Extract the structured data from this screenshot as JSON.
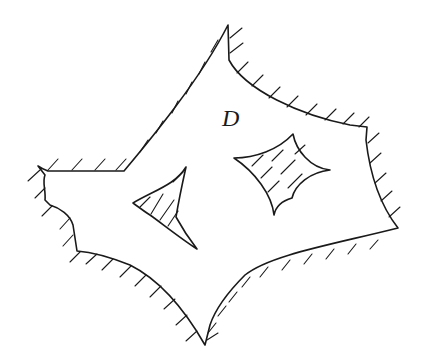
{
  "diagram": {
    "type": "multiply-connected domain sketch",
    "domain_label": "D",
    "outer_boundary": {
      "description": "Outer boundary of domain with exterior hatching",
      "hatched": true
    },
    "holes": [
      {
        "name": "triangular-hole",
        "shape": "concave triangle",
        "hatched": true
      },
      {
        "name": "quadrilateral-hole",
        "shape": "concave quadrilateral (astroid-like)",
        "hatched": true
      }
    ],
    "colors": {
      "stroke": "#1a1a1a",
      "background": "#ffffff"
    }
  }
}
